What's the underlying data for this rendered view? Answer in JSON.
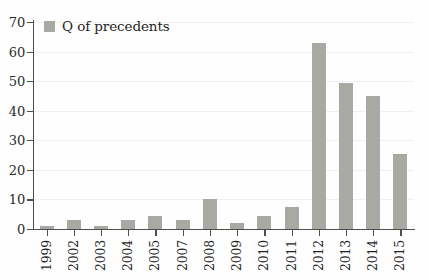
{
  "chart_data": {
    "type": "bar",
    "title": "",
    "xlabel": "",
    "ylabel": "",
    "categories": [
      "1999",
      "2002",
      "2003",
      "2004",
      "2005",
      "2007",
      "2008",
      "2009",
      "2010",
      "2011",
      "2012",
      "2013",
      "2014",
      "2015"
    ],
    "series": [
      {
        "name": "Q of precedents",
        "values": [
          1,
          3,
          1,
          3,
          4.3,
          3.2,
          10.2,
          2.2,
          4.4,
          7.3,
          63,
          49.3,
          45,
          25.4
        ]
      }
    ],
    "ylim": [
      0,
      70
    ],
    "yticks": [
      0,
      10,
      20,
      30,
      40,
      50,
      60,
      70
    ],
    "ytick_labels": [
      "0",
      "10",
      "20",
      "30",
      "40",
      "50",
      "60",
      "70"
    ],
    "grid": "horizontal",
    "legend_position": "top-left",
    "bar_color": "#a9a9a4",
    "axis_color": "#4f4f4f",
    "gridline_color": "#f0efed",
    "background_color": "#fefefe"
  },
  "legend": {
    "entries": [
      {
        "label": "Q of precedents",
        "swatch_color": "#a9a9a4"
      }
    ]
  }
}
